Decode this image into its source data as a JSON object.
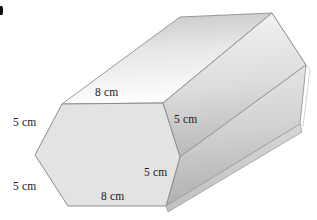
{
  "figure": {
    "name": "hexagonal-prism-diagram",
    "shape": "hexagonal prism",
    "corner_mark": "•"
  },
  "labels": {
    "top_edge": "8 cm",
    "upper_left_edge": "5 cm",
    "lower_left_edge": "5 cm",
    "depth_edge": "5 cm",
    "lower_right_edge": "5 cm",
    "bottom_edge": "8 cm"
  },
  "colors": {
    "front_face": "#e2e2e2",
    "top_face_light": "#ffffff",
    "top_face_dark": "#c8c8c8",
    "side_face_light": "#e8e8e8",
    "side_face_dark": "#a9a9a9",
    "outline": "#8c8c8c",
    "text": "#1b1b1b",
    "background": "#ffffff"
  }
}
